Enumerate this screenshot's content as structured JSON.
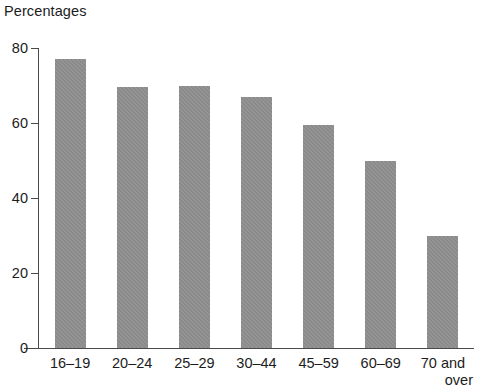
{
  "chart_data": {
    "type": "bar",
    "title": "Percentages",
    "xlabel": "",
    "ylabel": "",
    "categories": [
      "16–19",
      "20–24",
      "25–29",
      "30–44",
      "45–59",
      "60–69",
      "70 and over"
    ],
    "category_lines": [
      [
        "16–19"
      ],
      [
        "20–24"
      ],
      [
        "25–29"
      ],
      [
        "30–44"
      ],
      [
        "45–59"
      ],
      [
        "60–69"
      ],
      [
        "70 and",
        "over"
      ]
    ],
    "values": [
      77,
      69.5,
      70,
      67,
      59.5,
      50,
      30
    ],
    "ylim": [
      0,
      80
    ],
    "yticks": [
      0,
      20,
      40,
      60,
      80
    ],
    "ytick_labels": [
      "0",
      "20",
      "40",
      "60",
      "80"
    ],
    "grid": false,
    "legend": false,
    "bar_color": "#8a8a8a",
    "axis_color": "#4a4a4a",
    "text_color": "#1c1c1c",
    "background": "#ffffff"
  }
}
